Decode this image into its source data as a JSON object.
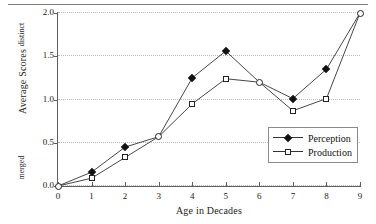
{
  "chart_data": {
    "type": "line",
    "title": "",
    "xlabel": "Age in Decades",
    "ylabel": "Average Scores",
    "x": [
      0,
      1,
      2,
      3,
      4,
      5,
      6,
      7,
      8,
      9
    ],
    "xticklabels": [
      "0",
      "1",
      "2",
      "3",
      "4",
      "5",
      "6",
      "7",
      "8",
      "9"
    ],
    "yticklabels": [
      "0.0",
      "0.5",
      "1.0",
      "1.5",
      "2.0"
    ],
    "ytickvalues": [
      0.0,
      0.5,
      1.0,
      1.5,
      2.0
    ],
    "xlim": [
      0,
      9
    ],
    "ylim": [
      0.0,
      2.0
    ],
    "grid": true,
    "grid_axis": "y",
    "legend_position": "lower-right",
    "y_pole_high": "distinct",
    "y_pole_low": "merged",
    "series": [
      {
        "name": "Perception",
        "marker": "filled-diamond",
        "values": [
          0.0,
          0.16,
          0.45,
          0.57,
          1.25,
          1.56,
          1.2,
          1.01,
          1.35,
          2.0
        ]
      },
      {
        "name": "Production",
        "marker": "open-square",
        "values": [
          0.0,
          0.09,
          0.33,
          0.57,
          0.95,
          1.24,
          1.2,
          0.87,
          1.01,
          2.0
        ]
      }
    ],
    "shared_endpoints": [
      {
        "x": 0,
        "y": 0.0,
        "marker": "open-circle"
      },
      {
        "x": 3,
        "y": 0.57,
        "marker": "open-circle"
      },
      {
        "x": 6,
        "y": 1.2,
        "marker": "open-circle"
      },
      {
        "x": 9,
        "y": 2.0,
        "marker": "open-circle"
      }
    ]
  },
  "legend": {
    "items": [
      {
        "label": "Perception",
        "marker": "filled-diamond"
      },
      {
        "label": "Production",
        "marker": "open-square"
      }
    ]
  },
  "axes": {
    "x_title": "Age in Decades",
    "y_title": "Average Scores",
    "y_pole_top": "distinct",
    "y_pole_bottom": "merged"
  }
}
